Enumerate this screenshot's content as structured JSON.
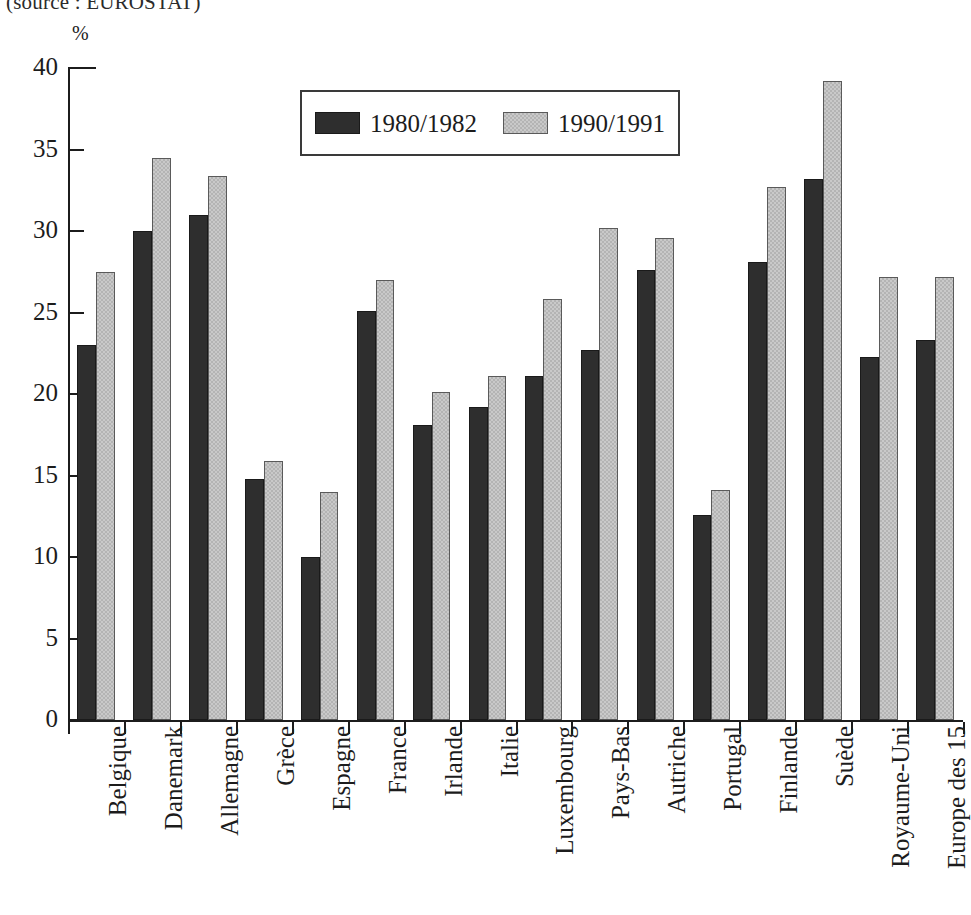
{
  "source_note": "(source : EUROSTAT)",
  "unit_label": "%",
  "legend": {
    "entries": [
      {
        "label": "1980/1982",
        "swatch": "dark-swatch-icon",
        "color": "#2e2e2e"
      },
      {
        "label": "1990/1991",
        "swatch": "light-swatch-icon",
        "color": "#c9c9c9"
      }
    ]
  },
  "axis": {
    "y_ticks": [
      "0",
      "5",
      "10",
      "15",
      "20",
      "25",
      "30",
      "35",
      "40"
    ]
  },
  "chart_data": {
    "type": "bar",
    "title": "",
    "subtitle": "(source : EUROSTAT)",
    "xlabel": "",
    "ylabel": "%",
    "ylim": [
      0,
      40
    ],
    "ytick_step": 5,
    "grid": false,
    "legend_position": "top-center",
    "categories": [
      "Belgique",
      "Danemark",
      "Allemagne",
      "Grèce",
      "Espagne",
      "France",
      "Irlande",
      "Italie",
      "Luxembourg",
      "Pays-Bas",
      "Autriche",
      "Portugal",
      "Finlande",
      "Suède",
      "Royaume-Uni",
      "Europe des 15"
    ],
    "series": [
      {
        "name": "1980/1982",
        "color": "#2e2e2e",
        "values": [
          23.0,
          30.0,
          31.0,
          14.8,
          10.0,
          25.1,
          18.1,
          19.2,
          21.1,
          22.7,
          27.6,
          12.6,
          28.1,
          33.2,
          22.3,
          23.3
        ]
      },
      {
        "name": "1990/1991",
        "color": "#c9c9c9",
        "values": [
          27.5,
          34.5,
          33.4,
          15.9,
          14.0,
          27.0,
          20.1,
          21.1,
          25.8,
          30.2,
          29.6,
          14.1,
          32.7,
          39.2,
          27.2,
          27.2
        ]
      }
    ]
  }
}
